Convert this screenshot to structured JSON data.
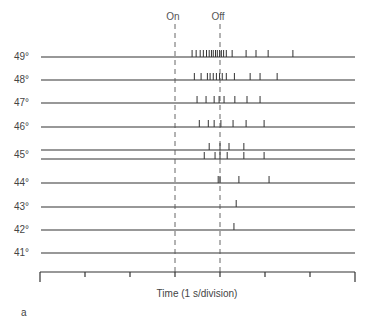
{
  "chart_data": {
    "type": "raster",
    "title": "",
    "panel_label": "a",
    "xlabel": "Time (1 s/division)",
    "ylabel": "Temperature",
    "markers": [
      {
        "label": "On",
        "time_s": 3.0
      },
      {
        "label": "Off",
        "time_s": 4.0
      }
    ],
    "x_range_s": [
      0,
      7
    ],
    "x_ticks_s": [
      0,
      1,
      2,
      3,
      4,
      5,
      6,
      7
    ],
    "rows": [
      {
        "label": "49°",
        "spikes_s": [
          3.38,
          3.47,
          3.56,
          3.63,
          3.7,
          3.76,
          3.81,
          3.85,
          3.9,
          3.94,
          3.99,
          4.03,
          4.08,
          4.14,
          4.27,
          4.58,
          4.8,
          5.07,
          5.62
        ]
      },
      {
        "label": "48°",
        "spikes_s": [
          3.43,
          3.58,
          3.72,
          3.78,
          3.85,
          3.92,
          3.99,
          4.05,
          4.14,
          4.32,
          4.67,
          4.89,
          5.27
        ]
      },
      {
        "label": "47°",
        "spikes_s": [
          3.49,
          3.69,
          3.87,
          3.98,
          4.09,
          4.33,
          4.6,
          4.89
        ]
      },
      {
        "label": "46°",
        "spikes_s": [
          3.54,
          3.74,
          3.87,
          4.02,
          4.29,
          4.58,
          4.98
        ]
      },
      {
        "label": "45°",
        "sub": "a",
        "spikes_s": [
          3.76,
          4.0,
          4.2,
          4.53
        ]
      },
      {
        "label": "45°",
        "sub": "b",
        "spikes_s": [
          3.65,
          3.89,
          4.0,
          4.16,
          4.53,
          4.98
        ]
      },
      {
        "label": "44°",
        "spikes_s": [
          3.96,
          4.0,
          4.42,
          5.09
        ]
      },
      {
        "label": "43°",
        "spikes_s": [
          4.36
        ]
      },
      {
        "label": "42°",
        "spikes_s": [
          4.31
        ]
      },
      {
        "label": "41°",
        "spikes_s": []
      }
    ]
  },
  "labels": {
    "on": "On",
    "off": "Off",
    "xlabel": "Time (1 s/division)",
    "panel": "a",
    "rows": [
      "49°",
      "48°",
      "47°",
      "46°",
      "45°",
      "44°",
      "43°",
      "42°",
      "41°"
    ]
  },
  "layout": {
    "x0": 40,
    "x1": 355,
    "row_y": [
      57,
      80,
      103,
      127,
      150,
      159,
      183,
      207,
      230,
      253
    ],
    "axis_y": 272,
    "line_color": "#333333",
    "dash_color": "#555555"
  }
}
